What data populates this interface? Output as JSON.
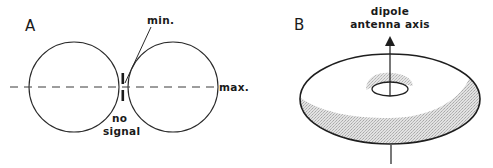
{
  "panels": {
    "a": {
      "label": "A",
      "annotations": {
        "min": "min.",
        "max": "max.",
        "no_signal_line1": "no",
        "no_signal_line2": "signal"
      }
    },
    "b": {
      "label": "B",
      "annotations": {
        "axis_line1": "dipole",
        "axis_line2": "antenna axis"
      }
    }
  },
  "colors": {
    "stroke": "#2a2a2a",
    "shading": "#c8c8c8",
    "background": "#ffffff"
  }
}
